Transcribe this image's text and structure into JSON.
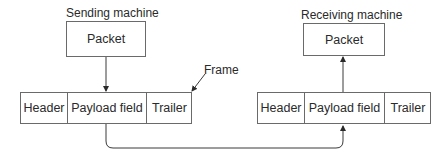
{
  "diagram": {
    "type": "frame-encapsulation",
    "sender": {
      "label": "Sending machine",
      "packet_label": "Packet",
      "frame": {
        "fields": [
          {
            "label": "Header"
          },
          {
            "label": "Payload field"
          },
          {
            "label": "Trailer"
          }
        ]
      }
    },
    "receiver": {
      "label": "Receiving machine",
      "packet_label": "Packet",
      "frame": {
        "fields": [
          {
            "label": "Header"
          },
          {
            "label": "Payload field"
          },
          {
            "label": "Trailer"
          }
        ]
      }
    },
    "frame_callout": "Frame",
    "colors": {
      "line": "#3a3a3a",
      "box_border": "#6a6a6a",
      "text": "#2a2a2a"
    }
  }
}
